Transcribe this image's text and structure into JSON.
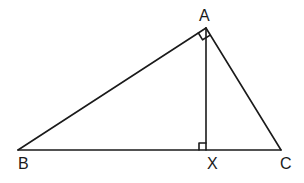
{
  "diagram": {
    "points": {
      "A": {
        "label": "A",
        "x": 206,
        "y": 28
      },
      "B": {
        "label": "B",
        "x": 18,
        "y": 150
      },
      "C": {
        "label": "C",
        "x": 281,
        "y": 150
      },
      "X": {
        "label": "X",
        "x": 206,
        "y": 150
      }
    },
    "segments": [
      "AB",
      "AC",
      "BC",
      "AX"
    ],
    "right_angles": [
      "BAC",
      "AXC"
    ],
    "stroke_color": "#1a1a1a"
  }
}
